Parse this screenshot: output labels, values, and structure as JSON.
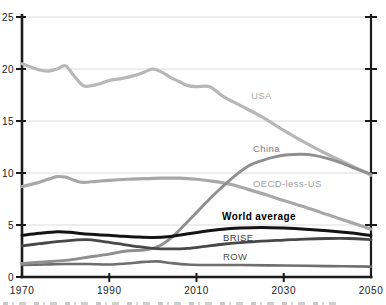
{
  "figure": {
    "background": "#ffffff",
    "axis_color": "#1b1b1b",
    "grid_color": "#dcdcdc",
    "tick_label_color": "#212121"
  },
  "chart_data": {
    "type": "line",
    "title": "",
    "xlabel": "",
    "ylabel": "",
    "x_range": [
      1970,
      2050
    ],
    "y_range": [
      0,
      25
    ],
    "x_ticks": [
      1970,
      1990,
      2010,
      2030,
      2050
    ],
    "x_tick_marks": [
      1990,
      2010,
      2030
    ],
    "y_ticks": [
      0,
      5,
      10,
      15,
      20,
      25
    ],
    "grid_values": [
      5,
      10,
      15,
      20,
      25
    ],
    "grid": "horizontal",
    "legend_position": "inline-labels",
    "series": [
      {
        "name": "USA",
        "color": "#b7b7b7",
        "width": 3.2,
        "label": {
          "text": "USA",
          "x_px": 251,
          "y_px": 99,
          "color": "#aeaeae",
          "bold": false
        },
        "points": [
          [
            1970,
            20.5
          ],
          [
            1972,
            20.2
          ],
          [
            1974,
            19.9
          ],
          [
            1976,
            19.8
          ],
          [
            1978,
            20.0
          ],
          [
            1980,
            20.3
          ],
          [
            1982,
            19.3
          ],
          [
            1984,
            18.4
          ],
          [
            1986,
            18.4
          ],
          [
            1988,
            18.6
          ],
          [
            1990,
            18.9
          ],
          [
            1993,
            19.1
          ],
          [
            1996,
            19.4
          ],
          [
            1998,
            19.7
          ],
          [
            2000,
            20.0
          ],
          [
            2002,
            19.7
          ],
          [
            2004,
            19.2
          ],
          [
            2006,
            18.8
          ],
          [
            2008,
            18.4
          ],
          [
            2010,
            18.3
          ],
          [
            2013,
            18.3
          ],
          [
            2016,
            17.4
          ],
          [
            2020,
            16.5
          ],
          [
            2025,
            15.4
          ],
          [
            2030,
            14.1
          ],
          [
            2035,
            12.9
          ],
          [
            2040,
            11.8
          ],
          [
            2045,
            10.8
          ],
          [
            2050,
            9.8
          ]
        ]
      },
      {
        "name": "OECD-less-US",
        "color": "#a8a8a8",
        "width": 3.2,
        "label": {
          "text": "OECD-less-US",
          "x_px": 253,
          "y_px": 187,
          "color": "#a0a0a0",
          "bold": false
        },
        "points": [
          [
            1970,
            8.7
          ],
          [
            1973,
            9.0
          ],
          [
            1976,
            9.4
          ],
          [
            1978,
            9.65
          ],
          [
            1980,
            9.6
          ],
          [
            1982,
            9.3
          ],
          [
            1984,
            9.1
          ],
          [
            1987,
            9.2
          ],
          [
            1990,
            9.3
          ],
          [
            1994,
            9.4
          ],
          [
            1998,
            9.45
          ],
          [
            2002,
            9.5
          ],
          [
            2006,
            9.5
          ],
          [
            2010,
            9.4
          ],
          [
            2014,
            9.2
          ],
          [
            2018,
            8.9
          ],
          [
            2022,
            8.4
          ],
          [
            2026,
            7.9
          ],
          [
            2030,
            7.35
          ],
          [
            2035,
            6.7
          ],
          [
            2040,
            6.0
          ],
          [
            2045,
            5.3
          ],
          [
            2050,
            4.6
          ]
        ]
      },
      {
        "name": "ROW",
        "color": "#6e6e6e",
        "width": 2.6,
        "label": {
          "text": "ROW",
          "x_px": 223,
          "y_px": 260,
          "color": "#4f4f4f",
          "bold": false
        },
        "points": [
          [
            1970,
            1.15
          ],
          [
            1975,
            1.2
          ],
          [
            1980,
            1.25
          ],
          [
            1985,
            1.25
          ],
          [
            1990,
            1.2
          ],
          [
            1994,
            1.3
          ],
          [
            1998,
            1.45
          ],
          [
            2001,
            1.5
          ],
          [
            2004,
            1.35
          ],
          [
            2008,
            1.2
          ],
          [
            2012,
            1.15
          ],
          [
            2016,
            1.15
          ],
          [
            2020,
            1.15
          ],
          [
            2030,
            1.1
          ],
          [
            2040,
            1.05
          ],
          [
            2050,
            1.0
          ]
        ]
      },
      {
        "name": "China",
        "color": "#8f8f8f",
        "width": 2.9,
        "label": {
          "text": "China",
          "x_px": 253,
          "y_px": 152,
          "color": "#7d7d7d",
          "bold": false
        },
        "points": [
          [
            1970,
            1.3
          ],
          [
            1975,
            1.45
          ],
          [
            1980,
            1.6
          ],
          [
            1985,
            1.9
          ],
          [
            1990,
            2.2
          ],
          [
            1994,
            2.5
          ],
          [
            1998,
            2.6
          ],
          [
            2001,
            2.9
          ],
          [
            2004,
            3.7
          ],
          [
            2007,
            4.9
          ],
          [
            2010,
            6.2
          ],
          [
            2013,
            7.5
          ],
          [
            2016,
            8.7
          ],
          [
            2019,
            9.8
          ],
          [
            2022,
            10.7
          ],
          [
            2025,
            11.2
          ],
          [
            2028,
            11.55
          ],
          [
            2031,
            11.75
          ],
          [
            2034,
            11.8
          ],
          [
            2037,
            11.7
          ],
          [
            2040,
            11.4
          ],
          [
            2043,
            11.0
          ],
          [
            2046,
            10.5
          ],
          [
            2050,
            9.9
          ]
        ]
      },
      {
        "name": "BRISE",
        "color": "#484848",
        "width": 2.8,
        "label": {
          "text": "BRISE",
          "x_px": 223,
          "y_px": 241,
          "color": "#3d3d3d",
          "bold": false
        },
        "points": [
          [
            1970,
            3.0
          ],
          [
            1974,
            3.2
          ],
          [
            1978,
            3.4
          ],
          [
            1982,
            3.55
          ],
          [
            1985,
            3.6
          ],
          [
            1988,
            3.45
          ],
          [
            1992,
            3.2
          ],
          [
            1996,
            2.95
          ],
          [
            2000,
            2.75
          ],
          [
            2004,
            2.7
          ],
          [
            2008,
            2.75
          ],
          [
            2012,
            2.95
          ],
          [
            2016,
            3.15
          ],
          [
            2020,
            3.3
          ],
          [
            2025,
            3.45
          ],
          [
            2030,
            3.55
          ],
          [
            2035,
            3.65
          ],
          [
            2040,
            3.7
          ],
          [
            2045,
            3.7
          ],
          [
            2050,
            3.6
          ]
        ]
      },
      {
        "name": "World average",
        "color": "#141414",
        "width": 3.0,
        "label": {
          "text": "World average",
          "x_px": 222,
          "y_px": 220,
          "color": "#000000",
          "bold": true
        },
        "points": [
          [
            1970,
            4.0
          ],
          [
            1974,
            4.2
          ],
          [
            1978,
            4.35
          ],
          [
            1981,
            4.3
          ],
          [
            1984,
            4.15
          ],
          [
            1988,
            4.05
          ],
          [
            1992,
            3.95
          ],
          [
            1996,
            3.85
          ],
          [
            2000,
            3.8
          ],
          [
            2004,
            3.9
          ],
          [
            2008,
            4.15
          ],
          [
            2012,
            4.4
          ],
          [
            2016,
            4.6
          ],
          [
            2020,
            4.7
          ],
          [
            2025,
            4.75
          ],
          [
            2030,
            4.7
          ],
          [
            2035,
            4.6
          ],
          [
            2040,
            4.45
          ],
          [
            2045,
            4.25
          ],
          [
            2050,
            4.0
          ]
        ]
      }
    ]
  }
}
